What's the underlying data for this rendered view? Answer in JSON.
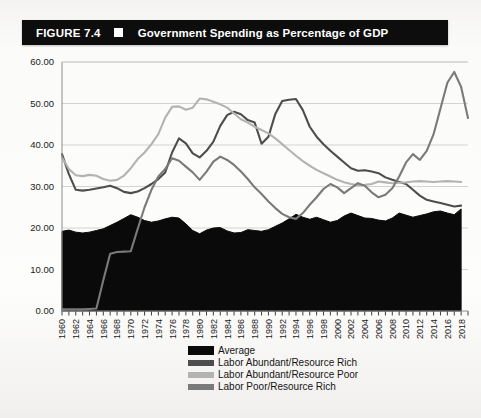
{
  "figure": {
    "number": "FIGURE 7.4",
    "marker": "white-square",
    "title": "Government Spending as Percentage of GDP"
  },
  "legend": {
    "position": "below-axis",
    "items": [
      {
        "label": "Average",
        "color": "#0a0a0a",
        "style": "block"
      },
      {
        "label": "Labor Abundant/Resource Rich",
        "color": "#4d4d4d",
        "style": "line"
      },
      {
        "label": "Labor Abundant/Resource Poor",
        "color": "#b3b3b3",
        "style": "line"
      },
      {
        "label": "Labor Poor/Resource Rich",
        "color": "#7a7a7a",
        "style": "line"
      }
    ]
  },
  "chart_data": {
    "type": "line",
    "title": "Government Spending as Percentage of GDP",
    "xlabel": "",
    "ylabel": "",
    "xlim": [
      1960,
      2019
    ],
    "ylim": [
      0,
      60
    ],
    "ytick_step": 10,
    "grid": true,
    "ytick_labels": [
      "0.00",
      "10.00",
      "20.00",
      "30.00",
      "40.00",
      "50.00",
      "60.00"
    ],
    "xtick_labels": [
      "1960",
      "1962",
      "1964",
      "1966",
      "1968",
      "1970",
      "1972",
      "1974",
      "1976",
      "1978",
      "1980",
      "1982",
      "1984",
      "1986",
      "1988",
      "1990",
      "1992",
      "1994",
      "1996",
      "1998",
      "2000",
      "2002",
      "2004",
      "2006",
      "2008",
      "2010",
      "2012",
      "2014",
      "2016",
      "2018"
    ],
    "x": [
      1960,
      1961,
      1962,
      1963,
      1964,
      1965,
      1966,
      1967,
      1968,
      1969,
      1970,
      1971,
      1972,
      1973,
      1974,
      1975,
      1976,
      1977,
      1978,
      1979,
      1980,
      1981,
      1982,
      1983,
      1984,
      1985,
      1986,
      1987,
      1988,
      1989,
      1990,
      1991,
      1992,
      1993,
      1994,
      1995,
      1996,
      1997,
      1998,
      1999,
      2000,
      2001,
      2002,
      2003,
      2004,
      2005,
      2006,
      2007,
      2008,
      2009,
      2010,
      2011,
      2012,
      2013,
      2014,
      2015,
      2016,
      2017,
      2018
    ],
    "series": [
      {
        "name": "Average",
        "color": "#0a0a0a",
        "fill": true,
        "values": [
          19.2,
          19.5,
          19.0,
          18.8,
          19.0,
          19.4,
          19.8,
          20.6,
          21.4,
          22.3,
          23.2,
          22.6,
          21.8,
          21.4,
          21.7,
          22.2,
          22.6,
          22.4,
          21.0,
          19.4,
          18.6,
          19.5,
          20.0,
          20.1,
          19.3,
          18.8,
          18.9,
          19.6,
          19.4,
          19.2,
          19.6,
          20.4,
          21.2,
          22.2,
          23.3,
          22.6,
          22.1,
          22.6,
          22.0,
          21.4,
          21.8,
          22.9,
          23.6,
          23.0,
          22.4,
          22.3,
          21.9,
          21.7,
          22.4,
          23.6,
          23.1,
          22.6,
          23.0,
          23.4,
          23.9,
          24.1,
          23.6,
          23.2,
          24.6
        ]
      },
      {
        "name": "Labor Abundant/Resource Rich",
        "color": "#4d4d4d",
        "fill": false,
        "values": [
          37.8,
          33.0,
          29.2,
          29.0,
          29.2,
          29.5,
          29.8,
          30.2,
          29.6,
          28.7,
          28.4,
          28.8,
          29.6,
          30.6,
          31.8,
          33.4,
          38.2,
          41.6,
          40.4,
          38.0,
          37.0,
          38.6,
          40.8,
          44.6,
          47.2,
          48.0,
          47.4,
          46.0,
          45.4,
          40.3,
          42.0,
          47.5,
          50.6,
          50.9,
          51.1,
          48.4,
          44.4,
          42.0,
          40.2,
          38.6,
          37.2,
          35.8,
          34.4,
          33.8,
          33.9,
          33.6,
          33.2,
          32.2,
          31.6,
          31.1,
          30.6,
          29.2,
          27.8,
          26.8,
          26.4,
          26.0,
          25.6,
          25.2,
          25.4
        ]
      },
      {
        "name": "Labor Abundant/Resource Poor",
        "color": "#b3b3b3",
        "fill": false,
        "values": [
          37.0,
          34.2,
          32.7,
          32.5,
          32.8,
          32.6,
          31.8,
          31.4,
          31.6,
          32.6,
          34.4,
          36.6,
          38.2,
          40.2,
          42.6,
          46.6,
          49.2,
          49.3,
          48.5,
          49.0,
          51.2,
          51.0,
          50.4,
          49.8,
          49.0,
          47.6,
          46.2,
          45.4,
          44.4,
          43.6,
          42.8,
          41.6,
          40.2,
          38.8,
          37.4,
          36.1,
          35.0,
          34.0,
          33.2,
          32.4,
          31.6,
          31.0,
          30.6,
          30.3,
          30.4,
          30.6,
          31.2,
          31.0,
          30.8,
          30.9,
          31.0,
          31.2,
          31.3,
          31.2,
          31.1,
          31.2,
          31.3,
          31.2,
          31.1
        ]
      },
      {
        "name": "Labor Poor/Resource Rich",
        "color": "#7a7a7a",
        "fill": false,
        "values": [
          0.4,
          0.4,
          0.4,
          0.4,
          0.5,
          0.6,
          7.4,
          13.8,
          14.2,
          14.3,
          14.4,
          19.8,
          25.0,
          29.2,
          32.4,
          34.2,
          36.8,
          36.2,
          34.8,
          33.4,
          31.6,
          33.6,
          36.0,
          37.2,
          36.4,
          35.2,
          33.6,
          31.8,
          29.8,
          28.2,
          26.4,
          24.8,
          23.4,
          22.6,
          22.2,
          23.6,
          25.6,
          27.4,
          29.4,
          30.6,
          29.8,
          28.4,
          29.6,
          30.8,
          30.2,
          28.6,
          27.4,
          28.0,
          29.6,
          32.4,
          35.8,
          37.8,
          36.4,
          38.6,
          42.6,
          48.8,
          55.0,
          57.6,
          54.0
        ]
      }
    ],
    "final_point_note": {
      "series": "Labor Poor/Resource Rich",
      "value": 46.5
    }
  }
}
